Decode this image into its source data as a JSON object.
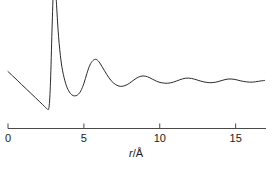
{
  "chart_data": {
    "type": "line",
    "title": "",
    "subtitle": "",
    "xlabel": "r/Å",
    "xlabel_parts": {
      "variable": "r",
      "separator": "/",
      "unit": "Å"
    },
    "ylabel": "",
    "xlim": [
      0,
      17
    ],
    "ylim": [
      0,
      1
    ],
    "grid": false,
    "legend": null,
    "xticks": [
      0,
      5,
      10,
      15
    ],
    "xtick_labels": [
      "0",
      "5",
      "10",
      "15"
    ],
    "yticks": [],
    "ytick_labels": [],
    "series": [
      {
        "name": "radial distribution function",
        "color": "#2b2b2b",
        "linewidth": 1,
        "note": "First peak is clipped by the top edge of the figure",
        "x": [
          0.0,
          0.3,
          0.6,
          0.9,
          1.2,
          1.5,
          1.8,
          2.1,
          2.4,
          2.55,
          2.7,
          2.8,
          2.9,
          3.0,
          3.1,
          3.2,
          3.3,
          3.45,
          3.6,
          3.8,
          4.0,
          4.2,
          4.4,
          4.6,
          4.8,
          5.0,
          5.2,
          5.4,
          5.6,
          5.8,
          6.0,
          6.2,
          6.5,
          6.8,
          7.1,
          7.4,
          7.7,
          8.0,
          8.3,
          8.6,
          8.9,
          9.2,
          9.5,
          9.8,
          10.1,
          10.5,
          10.9,
          11.3,
          11.7,
          12.1,
          12.5,
          12.9,
          13.3,
          13.7,
          14.1,
          14.5,
          14.9,
          15.3,
          15.7,
          16.1,
          16.5,
          16.9
        ],
        "y": [
          0.405,
          0.375,
          0.344,
          0.313,
          0.282,
          0.251,
          0.22,
          0.189,
          0.158,
          0.142,
          0.15,
          0.33,
          0.7,
          1.01,
          1.04,
          0.88,
          0.7,
          0.52,
          0.41,
          0.32,
          0.268,
          0.24,
          0.232,
          0.24,
          0.268,
          0.32,
          0.392,
          0.452,
          0.484,
          0.492,
          0.474,
          0.44,
          0.386,
          0.34,
          0.312,
          0.3,
          0.305,
          0.322,
          0.346,
          0.366,
          0.374,
          0.368,
          0.352,
          0.336,
          0.326,
          0.322,
          0.33,
          0.346,
          0.358,
          0.356,
          0.344,
          0.332,
          0.326,
          0.33,
          0.342,
          0.352,
          0.35,
          0.34,
          0.332,
          0.33,
          0.336,
          0.342
        ]
      }
    ],
    "axis": {
      "color": "#4a4a4a",
      "x_start": 0,
      "x_end": 17,
      "tick_direction": "up"
    }
  },
  "figure": {
    "background": "#ffffff",
    "width": 276,
    "height": 170
  }
}
